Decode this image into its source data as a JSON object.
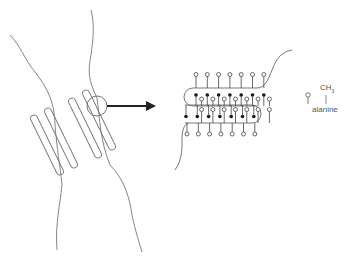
{
  "diagram": {
    "left_panel": {
      "membrane": "lipid bilayer boundaries (two wavy lines)",
      "hairpin_count": 4,
      "magnifier": "circle highlighting a region of the strands"
    },
    "arrow": {
      "direction": "right",
      "meaning": "zoom into circled region"
    },
    "right_panel": {
      "strand_loops": 2,
      "residues_per_row": 7,
      "filled_marker": "backbone residue",
      "open_marker": "side chain (alanine)"
    },
    "legend": {
      "symbol": "open-circle-on-stem",
      "formula_main": "CH",
      "formula_sub": "3",
      "name": "alanine"
    }
  }
}
